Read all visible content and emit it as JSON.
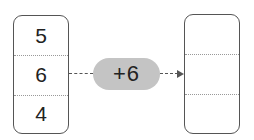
{
  "input_column": {
    "values": [
      "5",
      "6",
      "4"
    ]
  },
  "operation": {
    "label": "+6"
  },
  "output_column": {
    "values": [
      "",
      "",
      ""
    ]
  },
  "colors": {
    "pill": "#c4c4c4",
    "border": "#555555"
  }
}
